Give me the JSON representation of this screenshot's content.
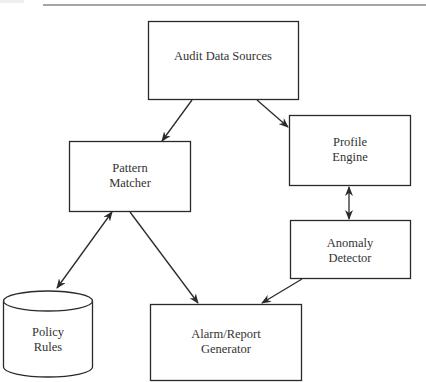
{
  "diagram": {
    "nodes": {
      "audit": {
        "label": "Audit Data Sources"
      },
      "pattern": {
        "line1": "Pattern",
        "line2": "Matcher"
      },
      "profile": {
        "line1": "Profile",
        "line2": "Engine"
      },
      "anomaly": {
        "line1": "Anomaly",
        "line2": "Detector"
      },
      "policy": {
        "line1": "Policy",
        "line2": "Rules"
      },
      "alarm": {
        "line1": "Alarm/Report",
        "line2": "Generator"
      }
    },
    "edges": [
      {
        "from": "Audit Data Sources",
        "to": "Pattern Matcher",
        "direction": "forward"
      },
      {
        "from": "Audit Data Sources",
        "to": "Profile Engine",
        "direction": "forward"
      },
      {
        "from": "Profile Engine",
        "to": "Anomaly Detector",
        "direction": "both"
      },
      {
        "from": "Pattern Matcher",
        "to": "Policy Rules",
        "direction": "both"
      },
      {
        "from": "Pattern Matcher",
        "to": "Alarm/Report Generator",
        "direction": "forward"
      },
      {
        "from": "Anomaly Detector",
        "to": "Alarm/Report Generator",
        "direction": "forward"
      }
    ],
    "colors": {
      "stroke": "#2a2a2a",
      "text": "#333333",
      "rule": "#888888"
    }
  }
}
